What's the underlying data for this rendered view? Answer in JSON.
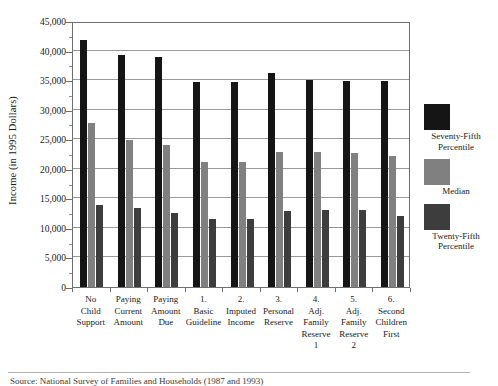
{
  "chart_data": {
    "type": "bar",
    "title": "",
    "xlabel": "",
    "ylabel": "Income (in 1995 Dollars)",
    "ylim": [
      0,
      45000
    ],
    "ytick_values": [
      0,
      5000,
      10000,
      15000,
      20000,
      25000,
      30000,
      35000,
      40000,
      45000
    ],
    "ytick_labels": [
      "0",
      "5,000",
      "10,000",
      "15,000",
      "20,000",
      "25,000",
      "30,000",
      "35,000",
      "40,000",
      "45,000"
    ],
    "grid": true,
    "legend_position": "right",
    "categories": [
      "No\nChild\nSupport",
      "Paying\nCurrent\nAmount",
      "Paying\nAmount\nDue",
      "1.\nBasic\nGuideline",
      "2.\nImputed\nIncome",
      "3.\nPersonal\nReserve",
      "4.\nAdj.\nFamily\nReserve\n1",
      "5.\nAdj.\nFamily\nReserve\n2",
      "6.\nSecond\nChildren\nFirst"
    ],
    "series": [
      {
        "name": "Seventy-Fifth\nPercentile",
        "color": "#151515",
        "values": [
          41800,
          39200,
          38900,
          34600,
          34600,
          36200,
          35000,
          34800,
          34800
        ]
      },
      {
        "name": "Median",
        "color": "#808080",
        "values": [
          27700,
          24900,
          24100,
          21100,
          21200,
          22900,
          22800,
          22700,
          22100
        ]
      },
      {
        "name": "Twenty-Fifth\nPercentile",
        "color": "#3d3d3d",
        "values": [
          13900,
          13300,
          12500,
          11500,
          11500,
          12900,
          13000,
          13000,
          12000
        ]
      }
    ]
  },
  "footer": {
    "source_note": "Source: National Survey of Families and Households (1987 and 1993)"
  }
}
